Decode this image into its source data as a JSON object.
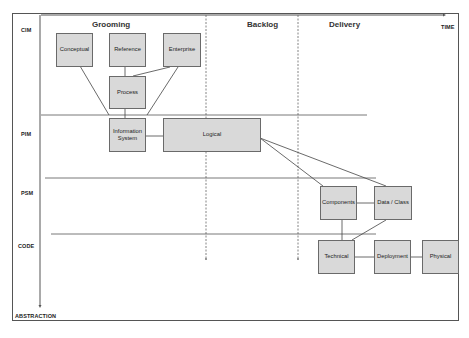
{
  "phases": [
    "Grooming",
    "Backlog",
    "Delivery"
  ],
  "axes": {
    "time_label": "TIME",
    "abstraction_label": "ABSTRACTION"
  },
  "levels": [
    "CIM",
    "PIM",
    "PSM",
    "CODE"
  ],
  "boxes": {
    "conceptual": "Conceptual",
    "reference": "Reference",
    "enterprise": "Enterprise",
    "process": "Process",
    "information_system_line1": "Information",
    "information_system_line2": "System",
    "logical": "Logical",
    "components": "Components",
    "data_class": "Data / Class",
    "technical": "Technical",
    "deployment": "Deployment",
    "physical": "Physical"
  },
  "colors": {
    "box_fill": "#d9d9d9",
    "box_border": "#6a6a6a",
    "line": "#444444"
  }
}
